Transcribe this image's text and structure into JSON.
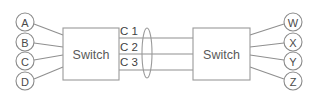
{
  "diagram": {
    "type": "network-topology",
    "background_color": "#ffffff",
    "line_color": "#8f8f8f",
    "text_color": "#4a4a4a",
    "left_switch": {
      "label": "Switch",
      "x": 63,
      "y": 28,
      "width": 56,
      "height": 52
    },
    "right_switch": {
      "label": "Switch",
      "x": 193,
      "y": 28,
      "width": 57,
      "height": 52
    },
    "left_nodes": [
      {
        "label": "A",
        "cx": 25,
        "cy": 22,
        "r": 9
      },
      {
        "label": "B",
        "cx": 25,
        "cy": 42,
        "r": 9
      },
      {
        "label": "C",
        "cx": 25,
        "cy": 61,
        "r": 9
      },
      {
        "label": "D",
        "cx": 25,
        "cy": 81,
        "r": 9
      }
    ],
    "right_nodes": [
      {
        "label": "W",
        "cx": 293,
        "cy": 22,
        "r": 9
      },
      {
        "label": "X",
        "cx": 293,
        "cy": 42,
        "r": 9
      },
      {
        "label": "Y",
        "cx": 293,
        "cy": 61,
        "r": 9
      },
      {
        "label": "Z",
        "cx": 293,
        "cy": 81,
        "r": 9
      }
    ],
    "left_links": [
      {
        "from": "A",
        "x1": 34,
        "y1": 24,
        "x2": 63,
        "y2": 35
      },
      {
        "from": "B",
        "x1": 34,
        "y1": 43,
        "x2": 63,
        "y2": 47
      },
      {
        "from": "C",
        "x1": 34,
        "y1": 60,
        "x2": 63,
        "y2": 55
      },
      {
        "from": "D",
        "x1": 34,
        "y1": 79,
        "x2": 63,
        "y2": 67
      }
    ],
    "right_links": [
      {
        "to": "W",
        "x1": 250,
        "y1": 35,
        "x2": 284,
        "y2": 24
      },
      {
        "to": "X",
        "x1": 250,
        "y1": 47,
        "x2": 284,
        "y2": 43
      },
      {
        "to": "Y",
        "x1": 250,
        "y1": 55,
        "x2": 284,
        "y2": 60
      },
      {
        "to": "Z",
        "x1": 250,
        "y1": 67,
        "x2": 284,
        "y2": 79
      }
    ],
    "trunk_cables": [
      {
        "label": "C 1",
        "label_x": 120,
        "label_y": 31,
        "line_y": 38,
        "x1": 119,
        "x2": 193
      },
      {
        "label": "C 2",
        "label_x": 120,
        "label_y": 47,
        "line_y": 54,
        "x1": 119,
        "x2": 193
      },
      {
        "label": "C 3",
        "label_x": 120,
        "label_y": 62,
        "line_y": 70,
        "x1": 119,
        "x2": 193
      }
    ],
    "bundle_marker": {
      "name": "cable-bundle-ellipse",
      "cx": 147,
      "cy": 53,
      "rx": 5,
      "ry": 25
    }
  }
}
